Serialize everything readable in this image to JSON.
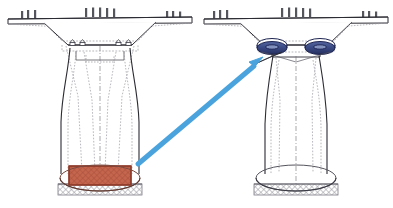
{
  "figure": {
    "title": "Bridge pier seismic retrofit comparison",
    "background_color": "#ffffff",
    "line_color": "#2b2b33",
    "hidden_line_color": "#8a8a92",
    "hatch_color": "#9a9aa2"
  },
  "panels": [
    {
      "id": "left-panel",
      "name": "conventional-pier",
      "label": "",
      "center_x": 100,
      "deck": {
        "name": "bridge-deck",
        "width": 186,
        "top_y": 18,
        "thickness": 7,
        "color": "#2b2b33"
      },
      "railing_posts": {
        "name": "railing-posts",
        "count_left": 3,
        "count_center": 5,
        "count_right": 3,
        "height": 8,
        "color": "#55555e"
      },
      "pier_cap": {
        "name": "pier-cap",
        "top_width": 116,
        "bottom_width": 64,
        "top_y": 25,
        "bottom_y": 45
      },
      "bearings": {
        "name": "pier-cap-bearings",
        "count": 4,
        "style": "small-block",
        "color": "#3a3a44",
        "highlighted": false
      },
      "column": {
        "name": "pier-column",
        "top_width": 60,
        "waist_width": 44,
        "bottom_width": 62,
        "top_y": 48,
        "bottom_y": 172,
        "shape": "flared-hollow"
      },
      "base_block": {
        "name": "fixed-base-block",
        "highlighted": true,
        "fill": "#c4654e",
        "stroke": "#8c3a28",
        "hatch": true,
        "width": 62,
        "height": 22,
        "top_y": 164,
        "label": ""
      },
      "footing": {
        "name": "foundation-footing",
        "width": 84,
        "height": 12,
        "top_y": 184,
        "hatch_color": "#9a9aa2"
      },
      "base_ellipse": {
        "name": "base-ellipse",
        "rx": 40,
        "ry": 13,
        "center_y": 178,
        "stroke": "#6b4038"
      }
    },
    {
      "id": "right-panel",
      "name": "isolated-pier",
      "label": "",
      "center_x": 296,
      "deck": {
        "name": "bridge-deck",
        "width": 186,
        "top_y": 18,
        "thickness": 7,
        "color": "#2b2b33"
      },
      "railing_posts": {
        "name": "railing-posts",
        "count_left": 3,
        "count_center": 5,
        "count_right": 3,
        "height": 8,
        "color": "#55555e"
      },
      "pier_cap": {
        "name": "pier-cap",
        "top_width": 116,
        "bottom_width": 64,
        "top_y": 25,
        "bottom_y": 45
      },
      "bearings": {
        "name": "isolation-bearings",
        "count": 2,
        "style": "elliptical-disc",
        "fill": "#3b4b86",
        "stroke": "#1d2450",
        "highlight_fill": "#8f9ec8",
        "rx": 14,
        "ry": 6,
        "center_y": 47,
        "offsets": [
          -24,
          24
        ],
        "highlighted": true,
        "label": ""
      },
      "column": {
        "name": "pier-column",
        "top_width": 46,
        "waist_width": 42,
        "bottom_width": 62,
        "top_y": 53,
        "bottom_y": 172,
        "shape": "flared-hollow"
      },
      "base_block": {
        "name": "fixed-base-block",
        "highlighted": false,
        "fill": "none",
        "stroke": "#55555e",
        "hatch": false,
        "width": 62,
        "height": 0,
        "top_y": 172,
        "label": ""
      },
      "footing": {
        "name": "foundation-footing",
        "width": 84,
        "height": 12,
        "top_y": 184,
        "hatch_color": "#9a9aa2"
      },
      "base_ellipse": {
        "name": "base-ellipse",
        "rx": 40,
        "ry": 13,
        "center_y": 178,
        "stroke": "#55555e"
      }
    }
  ],
  "annotation_arrow": {
    "name": "retrofit-arrow",
    "color": "#4aa3dd",
    "stroke_width": 5,
    "tail_x": 138,
    "tail_y": 164,
    "head_x": 262,
    "head_y": 58,
    "head_size": 11,
    "label": ""
  },
  "legend": {
    "items": [
      {
        "name": "fixed-base",
        "label": "",
        "color": "#c4654e"
      },
      {
        "name": "isolation-bearing",
        "label": "",
        "color": "#3b4b86"
      },
      {
        "name": "retrofit-direction",
        "label": "",
        "color": "#4aa3dd"
      }
    ]
  }
}
